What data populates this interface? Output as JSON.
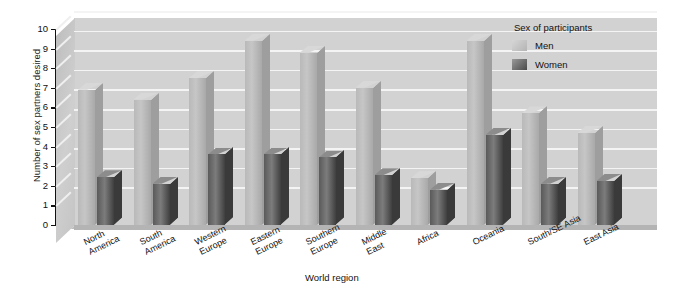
{
  "chart_data": {
    "type": "bar",
    "title": "",
    "xlabel": "World region",
    "ylabel": "Number of sex partners desired",
    "ylim": [
      0,
      10
    ],
    "yticks": [
      "0",
      "1",
      "2",
      "3",
      "4",
      "5",
      "6",
      "7",
      "8",
      "9",
      "10"
    ],
    "grid": true,
    "legend_position": "top-right",
    "legend_title": "Sex of participants",
    "categories": [
      "North America",
      "South America",
      "Western Europe",
      "Eastern Europe",
      "Southern Europe",
      "Middle East",
      "Africa",
      "Oceania",
      "South/SE Asia",
      "East Asia"
    ],
    "category_lines": [
      [
        "North",
        "America"
      ],
      [
        "South",
        "America"
      ],
      [
        "Western",
        "Europe"
      ],
      [
        "Eastern",
        "Europe"
      ],
      [
        "Southern",
        "Europe"
      ],
      [
        "Middle",
        "East"
      ],
      [
        "Africa",
        ""
      ],
      [
        "Oceania",
        ""
      ],
      [
        "South/SE Asia",
        ""
      ],
      [
        "East Asia",
        ""
      ]
    ],
    "series": [
      {
        "name": "Men",
        "color": "#bdbdbd",
        "values": [
          6.9,
          6.4,
          7.5,
          9.4,
          8.8,
          7.0,
          2.4,
          9.4,
          5.7,
          4.7
        ]
      },
      {
        "name": "Women",
        "color": "#4a4a4a",
        "values": [
          2.45,
          2.1,
          3.6,
          3.6,
          3.45,
          2.55,
          1.8,
          4.6,
          2.1,
          2.25
        ]
      }
    ]
  },
  "legend": {
    "title": "Sex of participants",
    "items": [
      {
        "label": "Men"
      },
      {
        "label": "Women"
      }
    ]
  },
  "axes": {
    "y_title": "Number of sex partners desired",
    "x_title": "World region"
  }
}
